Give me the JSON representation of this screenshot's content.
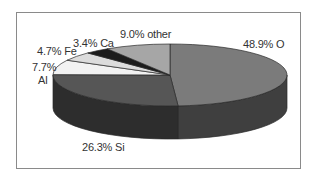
{
  "chart_data": {
    "type": "pie",
    "style": "3d-pie",
    "title": "",
    "slices": [
      {
        "label": "O",
        "value": 48.9,
        "display": "48.9% O",
        "top_color": "#7b7b7b",
        "side_color": "#3f3f3f"
      },
      {
        "label": "Si",
        "value": 26.3,
        "display": "26.3% Si",
        "top_color": "#565656",
        "side_color": "#2d2d2d"
      },
      {
        "label": "Al",
        "value": 7.7,
        "display_line1": "7.7%",
        "display_line2": "Al",
        "top_color": "#f2f2f2",
        "side_color": "#bdbdbd"
      },
      {
        "label": "Fe",
        "value": 4.7,
        "display": "4.7% Fe",
        "top_color": "#dcdcdc",
        "side_color": "#a8a8a8"
      },
      {
        "label": "Ca",
        "value": 3.4,
        "display": "3.4% Ca",
        "top_color": "#1c1c1c",
        "side_color": "#111111"
      },
      {
        "label": "other",
        "value": 9.0,
        "display": "9.0% other",
        "top_color": "#a6a6a6",
        "side_color": "#6e6e6e"
      }
    ],
    "legend": "none (direct labels)",
    "start_angle": "12 o'clock, clockwise"
  },
  "labels": {
    "o": "48.9% O",
    "si": "26.3% Si",
    "al_pct": "7.7%",
    "al_name": "Al",
    "fe": "4.7% Fe",
    "ca": "3.4% Ca",
    "other": "9.0% other"
  },
  "colors": {
    "frame_border": "#8a8a8a",
    "slice_outline": "#2a2a2a",
    "label_text": "#333333"
  }
}
